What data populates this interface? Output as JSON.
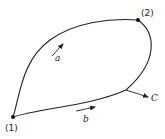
{
  "diagram": {
    "points": [
      {
        "id": "state-1",
        "label": "(1)"
      },
      {
        "id": "state-2",
        "label": "(2)"
      }
    ],
    "paths": [
      {
        "id": "path-a",
        "label": "a",
        "from": "(1)",
        "to": "(2)",
        "route": "upper-left curve"
      },
      {
        "id": "path-b",
        "label": "b",
        "from": "(1)",
        "to": "(2)",
        "route": "lower-right curve"
      },
      {
        "id": "path-c",
        "label": "C",
        "from": "(2)",
        "to": "(1)",
        "route": "branch arrow pointing right from lower path"
      }
    ],
    "colors": {
      "ink": "#222222",
      "background": "#ffffff"
    }
  }
}
